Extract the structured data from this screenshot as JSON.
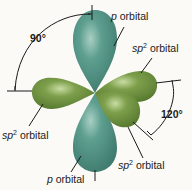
{
  "diagram": {
    "colors": {
      "p_orbital": "#4e9183",
      "sp2_orbital": "#6f943f",
      "background": "#fbfaf7",
      "line": "#1a1a1a"
    },
    "labels": {
      "p_top": {
        "prefix": "p",
        "suffix": " orbital"
      },
      "p_bottom": {
        "prefix": "p",
        "suffix": " orbital"
      },
      "sp2_upper_right": {
        "prefix": "sp",
        "sup": "2",
        "suffix": " orbital"
      },
      "sp2_left": {
        "prefix": "sp",
        "sup": "2",
        "suffix": " orbital"
      },
      "sp2_lower_right": {
        "prefix": "sp",
        "sup": "2",
        "suffix": " orbital"
      }
    },
    "angles": {
      "p_to_sp2": "90°",
      "sp2_to_sp2": "120°"
    }
  }
}
